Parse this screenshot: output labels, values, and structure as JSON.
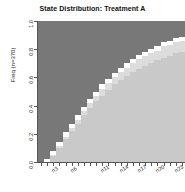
{
  "chart_data": {
    "type": "area",
    "title": "State Distribution: Treatment A",
    "xlabel": "",
    "ylabel": "Freq (n=370)",
    "ylim": [
      0.0,
      1.0
    ],
    "xlim": [
      1,
      24
    ],
    "grid": false,
    "legend": "none",
    "stacked": true,
    "stack_order_bottom_to_top": [
      "state-1",
      "state-2",
      "state-3",
      "state-4"
    ],
    "y_ticks": [
      "0.0",
      "0.2",
      "0.4",
      "0.6",
      "0.8",
      "1.0"
    ],
    "y_tick_values": [
      0.0,
      0.2,
      0.4,
      0.6,
      0.8,
      1.0
    ],
    "x_tick_count": 24,
    "x_labeled_positions": [
      3,
      6,
      11,
      14,
      17,
      20,
      23
    ],
    "x_tick_labels": [
      "n3",
      "n6",
      "n11",
      "n14",
      "n17",
      "n20",
      "n23"
    ],
    "categories": [
      "n1",
      "n2",
      "n3",
      "n4",
      "n5",
      "n6",
      "n7",
      "n8",
      "n9",
      "n10",
      "n11",
      "n12",
      "n13",
      "n14",
      "n15",
      "n16",
      "n17",
      "n18",
      "n19",
      "n20",
      "n21",
      "n22",
      "n23",
      "n24"
    ],
    "colors": {
      "state_1_bottom": "#c9c9c9",
      "state_2": "#dcdcdc",
      "state_3": "#ffffff",
      "state_4_top": "#787878",
      "axis": "#555555",
      "text": "#222222",
      "background": "#ffffff"
    },
    "series": [
      {
        "name": "state-1",
        "color": "#c9c9c9",
        "values": [
          0.0,
          0.0,
          0.04,
          0.1,
          0.16,
          0.22,
          0.27,
          0.33,
          0.38,
          0.43,
          0.47,
          0.51,
          0.55,
          0.58,
          0.61,
          0.64,
          0.66,
          0.68,
          0.7,
          0.72,
          0.74,
          0.75,
          0.77,
          0.78
        ]
      },
      {
        "name": "state-2",
        "color": "#dcdcdc",
        "values": [
          0.0,
          0.0,
          0.01,
          0.01,
          0.02,
          0.02,
          0.03,
          0.03,
          0.04,
          0.04,
          0.05,
          0.05,
          0.05,
          0.06,
          0.06,
          0.06,
          0.07,
          0.07,
          0.07,
          0.07,
          0.08,
          0.08,
          0.08,
          0.08
        ]
      },
      {
        "name": "state-3",
        "color": "#ffffff",
        "values": [
          0.0,
          0.02,
          0.03,
          0.03,
          0.03,
          0.03,
          0.03,
          0.03,
          0.03,
          0.03,
          0.03,
          0.03,
          0.03,
          0.03,
          0.03,
          0.03,
          0.03,
          0.03,
          0.03,
          0.03,
          0.03,
          0.03,
          0.03,
          0.03
        ]
      },
      {
        "name": "state-4",
        "color": "#787878",
        "values": [
          1.0,
          0.98,
          0.92,
          0.86,
          0.79,
          0.73,
          0.67,
          0.61,
          0.55,
          0.5,
          0.45,
          0.41,
          0.37,
          0.33,
          0.3,
          0.27,
          0.24,
          0.22,
          0.2,
          0.18,
          0.15,
          0.14,
          0.12,
          0.11
        ]
      }
    ],
    "cumulative_tops": {
      "note": "cumulative stacked upper boundary of each band, bottom-to-top",
      "state_1": [
        0.0,
        0.0,
        0.04,
        0.1,
        0.16,
        0.22,
        0.27,
        0.33,
        0.38,
        0.43,
        0.47,
        0.51,
        0.55,
        0.58,
        0.61,
        0.64,
        0.66,
        0.68,
        0.7,
        0.72,
        0.74,
        0.75,
        0.77,
        0.78
      ],
      "state_2": [
        0.0,
        0.0,
        0.05,
        0.11,
        0.18,
        0.24,
        0.3,
        0.36,
        0.42,
        0.47,
        0.52,
        0.56,
        0.6,
        0.64,
        0.67,
        0.7,
        0.73,
        0.75,
        0.77,
        0.79,
        0.82,
        0.83,
        0.85,
        0.86
      ],
      "state_3": [
        0.0,
        0.02,
        0.08,
        0.14,
        0.21,
        0.27,
        0.33,
        0.39,
        0.45,
        0.5,
        0.55,
        0.59,
        0.63,
        0.67,
        0.7,
        0.73,
        0.76,
        0.78,
        0.8,
        0.82,
        0.85,
        0.86,
        0.88,
        0.89
      ],
      "state_4": [
        1.0,
        1.0,
        1.0,
        1.0,
        1.0,
        1.0,
        1.0,
        1.0,
        1.0,
        1.0,
        1.0,
        1.0,
        1.0,
        1.0,
        1.0,
        1.0,
        1.0,
        1.0,
        1.0,
        1.0,
        1.0,
        1.0,
        1.0,
        1.0
      ]
    }
  }
}
